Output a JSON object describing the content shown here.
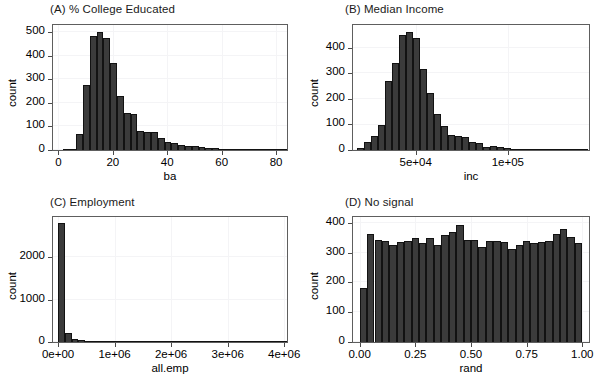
{
  "figure": {
    "width": 601,
    "height": 385,
    "background": "#ffffff",
    "bar_fill": "#3b3b3b",
    "bar_stroke": "#121212",
    "grid_color": "#f4f4f6",
    "frame_color": "#5e5e5e",
    "layout": "2x2 grid of histogram panels"
  },
  "chart_data": [
    {
      "id": "panel-a",
      "type": "bar",
      "title": "(A) % College Educated",
      "xlabel": "ba",
      "ylabel": "count",
      "xlim": [
        -2,
        84
      ],
      "ylim": [
        0,
        530
      ],
      "xticks": [
        0,
        20,
        40,
        60,
        80
      ],
      "xtick_labels": [
        "0",
        "20",
        "40",
        "60",
        "80"
      ],
      "yticks": [
        0,
        100,
        200,
        300,
        400,
        500
      ],
      "ytick_labels": [
        "0",
        "100",
        "200",
        "300",
        "400",
        "500"
      ],
      "grid": true,
      "bin_width": 2.5,
      "bin_starts": [
        1.5,
        4.0,
        6.5,
        9.0,
        11.5,
        14.0,
        16.5,
        19.0,
        21.5,
        24.0,
        26.5,
        29.0,
        31.5,
        34.0,
        36.5,
        39.0,
        41.5,
        44.0,
        46.5,
        49.0,
        51.5,
        54.0,
        56.5,
        59.0,
        61.5,
        64.0,
        66.5,
        69.0,
        71.5,
        74.0,
        76.5,
        79.0,
        81.5
      ],
      "values": [
        4,
        6,
        70,
        276,
        482,
        500,
        475,
        368,
        228,
        157,
        152,
        82,
        78,
        77,
        52,
        33,
        30,
        22,
        18,
        15,
        13,
        10,
        7,
        5,
        3,
        3,
        2,
        2,
        2,
        2,
        2,
        2,
        3
      ]
    },
    {
      "id": "panel-b",
      "type": "bar",
      "title": "(B) Median Income",
      "xlabel": "inc",
      "ylabel": "count",
      "xlim": [
        16000,
        144000
      ],
      "ylim": [
        0,
        490
      ],
      "xticks": [
        50000,
        100000
      ],
      "xtick_labels": [
        "5e+04",
        "1e+05"
      ],
      "yticks": [
        0,
        100,
        200,
        300,
        400
      ],
      "ytick_labels": [
        "0",
        "100",
        "200",
        "300",
        "400"
      ],
      "grid": true,
      "bin_width": 3800,
      "bin_starts": [
        18000,
        21800,
        25600,
        29400,
        33200,
        37000,
        40800,
        44600,
        48400,
        52200,
        56000,
        59800,
        63600,
        67400,
        71200,
        75000,
        78800,
        82600,
        86400,
        90200,
        94000,
        97800,
        101600,
        105400,
        109200,
        113000,
        116800,
        120600,
        124400,
        128200,
        132000,
        135800,
        139600
      ],
      "values": [
        8,
        30,
        56,
        100,
        270,
        340,
        450,
        462,
        440,
        318,
        225,
        142,
        95,
        60,
        55,
        50,
        30,
        28,
        13,
        14,
        11,
        8,
        5,
        4,
        4,
        3,
        3,
        2,
        2,
        2,
        2,
        2,
        4
      ]
    },
    {
      "id": "panel-c",
      "type": "bar",
      "title": "(C) Employment",
      "xlabel": "all.emp",
      "ylabel": "count",
      "xlim": [
        -90000,
        4050000
      ],
      "ylim": [
        0,
        2950
      ],
      "xticks": [
        0,
        1000000,
        2000000,
        3000000,
        4000000
      ],
      "xtick_labels": [
        "0e+00",
        "1e+06",
        "2e+06",
        "3e+06",
        "4e+06"
      ],
      "yticks": [
        0,
        1000,
        2000
      ],
      "ytick_labels": [
        "0",
        "1000",
        "2000"
      ],
      "grid": true,
      "bin_width": 120000,
      "bin_starts": [
        0,
        120000,
        240000,
        360000,
        480000,
        600000,
        720000,
        840000,
        960000,
        1080000,
        1200000,
        1320000,
        1440000,
        1560000,
        1680000,
        1800000,
        1920000,
        2040000,
        2160000,
        2280000,
        2400000,
        2520000,
        2640000,
        2760000,
        2880000,
        3000000,
        3120000,
        3240000,
        3360000,
        3480000,
        3600000,
        3720000,
        3840000,
        3960000
      ],
      "values": [
        2800,
        220,
        70,
        42,
        30,
        18,
        12,
        8,
        6,
        5,
        4,
        4,
        3,
        3,
        3,
        2,
        2,
        2,
        2,
        2,
        2,
        2,
        2,
        2,
        2,
        2,
        2,
        2,
        2,
        2,
        2,
        2,
        2,
        10
      ]
    },
    {
      "id": "panel-d",
      "type": "bar",
      "title": "(D) No signal",
      "xlabel": "rand",
      "ylabel": "count",
      "xlim": [
        -0.03,
        1.03
      ],
      "ylim": [
        0,
        420
      ],
      "xticks": [
        0.0,
        0.25,
        0.5,
        0.75,
        1.0
      ],
      "xtick_labels": [
        "0.00",
        "0.25",
        "0.50",
        "0.75",
        "1.00"
      ],
      "yticks": [
        0,
        100,
        200,
        300,
        400
      ],
      "ytick_labels": [
        "0",
        "100",
        "200",
        "300",
        "400"
      ],
      "grid": true,
      "bin_width": 0.0333,
      "bin_starts": [
        0.0,
        0.0333,
        0.0667,
        0.1,
        0.1333,
        0.1667,
        0.2,
        0.2333,
        0.2667,
        0.3,
        0.3333,
        0.3667,
        0.4,
        0.4333,
        0.4667,
        0.5,
        0.5333,
        0.5667,
        0.6,
        0.6333,
        0.6667,
        0.7,
        0.7333,
        0.7667,
        0.8,
        0.8333,
        0.8667,
        0.9,
        0.9333,
        0.9667
      ],
      "values": [
        182,
        364,
        342,
        340,
        325,
        335,
        338,
        350,
        332,
        350,
        326,
        358,
        368,
        393,
        343,
        342,
        318,
        340,
        338,
        336,
        313,
        327,
        339,
        332,
        337,
        341,
        363,
        381,
        352,
        334,
        185
      ]
    }
  ]
}
